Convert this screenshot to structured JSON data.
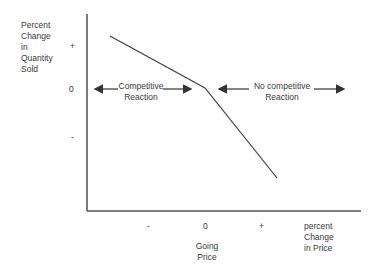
{
  "diagram": {
    "y_axis": {
      "label": "Percent\nChange\nin\nQuantity\nSold",
      "ticks": [
        "+",
        "0",
        "-"
      ]
    },
    "x_axis": {
      "label": "percent\nChange\nin Price",
      "ticks": [
        "-",
        "0",
        "+"
      ],
      "zero_caption": "Going\nPrice"
    },
    "regions": {
      "left": "Competitive\nReaction",
      "right": "No competitive\nReaction"
    },
    "curve": {
      "points": [
        [
          110,
          36
        ],
        [
          205,
          88
        ],
        [
          277,
          178
        ]
      ],
      "color": "#404040"
    }
  }
}
